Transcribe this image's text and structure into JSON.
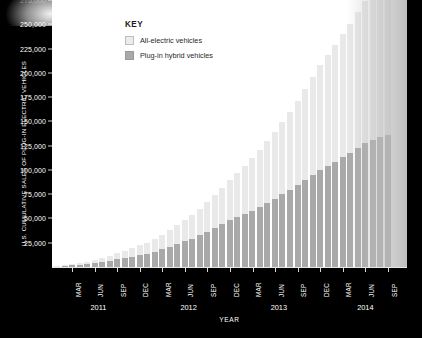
{
  "chart_data": {
    "type": "bar",
    "stacked": true,
    "title": "",
    "xlabel": "YEAR",
    "ylabel": "U.S. CUMULATIVE SALES OF PLUG-IN ELECTRIC VEHICLES",
    "ylim": [
      0,
      275000
    ],
    "ytick_values": [
      25000,
      50000,
      75000,
      100000,
      125000,
      150000,
      175000,
      200000,
      225000,
      250000,
      275000
    ],
    "ytick_labels": [
      "25,000",
      "50,000",
      "75,000",
      "100,000",
      "125,000",
      "150,000",
      "175,000",
      "200,000",
      "225,000",
      "250,000",
      "275,000"
    ],
    "ytick_top_obscured": true,
    "grid": false,
    "legend_position": "top-left",
    "legend_title": "KEY",
    "categories": [
      "JAN 2011",
      "FEB 2011",
      "MAR 2011",
      "APR 2011",
      "MAY 2011",
      "JUN 2011",
      "JUL 2011",
      "AUG 2011",
      "SEP 2011",
      "OCT 2011",
      "NOV 2011",
      "DEC 2011",
      "JAN 2012",
      "FEB 2012",
      "MAR 2012",
      "APR 2012",
      "MAY 2012",
      "JUN 2012",
      "JUL 2012",
      "AUG 2012",
      "SEP 2012",
      "OCT 2012",
      "NOV 2012",
      "DEC 2012",
      "JAN 2013",
      "FEB 2013",
      "MAR 2013",
      "APR 2013",
      "MAY 2013",
      "JUN 2013",
      "JUL 2013",
      "AUG 2013",
      "SEP 2013",
      "OCT 2013",
      "NOV 2013",
      "DEC 2013",
      "JAN 2014",
      "FEB 2014",
      "MAR 2014",
      "APR 2014",
      "MAY 2014",
      "JUN 2014",
      "JUL 2014",
      "AUG 2014",
      "SEP 2014"
    ],
    "xtick_month_labels": [
      "MAR",
      "JUN",
      "SEP",
      "DEC",
      "MAR",
      "JUN",
      "SEP",
      "DEC",
      "MAR",
      "JUN",
      "SEP",
      "DEC",
      "MAR",
      "JUN",
      "SEP"
    ],
    "xtick_month_indices": [
      2,
      5,
      8,
      11,
      14,
      17,
      20,
      23,
      26,
      29,
      32,
      35,
      38,
      41,
      44
    ],
    "year_labels": [
      "2011",
      "2012",
      "2013",
      "2014"
    ],
    "year_label_indices": [
      5.5,
      17.5,
      29.5,
      41.0
    ],
    "series": [
      {
        "name": "Plug-in hybrid vehicles",
        "color": "#a9a9a9",
        "values": [
          400,
          900,
          1700,
          2400,
          3100,
          4100,
          5200,
          6500,
          7800,
          9300,
          10700,
          12200,
          13800,
          15800,
          18300,
          20900,
          23500,
          26300,
          29300,
          32600,
          36100,
          39900,
          43800,
          48000,
          51300,
          54600,
          58200,
          62100,
          66200,
          70500,
          74900,
          79600,
          84400,
          89300,
          94500,
          99800,
          104000,
          108400,
          113100,
          117900,
          122800,
          127800,
          131000,
          133800,
          136000
        ]
      },
      {
        "name": "All-electric vehicles",
        "color": "#e9e9e9",
        "values": [
          300,
          700,
          1300,
          1900,
          2500,
          3300,
          4200,
          5200,
          6300,
          7500,
          8700,
          10000,
          11400,
          13100,
          15100,
          17300,
          19600,
          22000,
          24600,
          27500,
          30700,
          34200,
          38000,
          42000,
          45600,
          49400,
          53600,
          58200,
          63200,
          68500,
          74200,
          80300,
          86800,
          93700,
          101000,
          108600,
          114300,
          120200,
          126400,
          132800,
          139500,
          146400,
          152500,
          158000,
          163000
        ]
      }
    ],
    "total_final": 299000,
    "units": "vehicles"
  },
  "legend": {
    "title": "KEY",
    "items": [
      {
        "label": "All-electric vehicles",
        "swatch": "light-gray"
      },
      {
        "label": "Plug-in hybrid vehicles",
        "swatch": "medium-gray"
      }
    ]
  },
  "axes": {
    "y_title": "U.S. CUMULATIVE SALES OF PLUG-IN ELECTRIC VEHICLES",
    "x_title": "YEAR"
  },
  "colors": {
    "background": "#000000",
    "plot_background": "#ffffff",
    "all_electric": "#e9e9e9",
    "plug_in_hybrid": "#a9a9a9",
    "axis_text": "#ffffff",
    "legend_text": "#2a2a2a"
  }
}
